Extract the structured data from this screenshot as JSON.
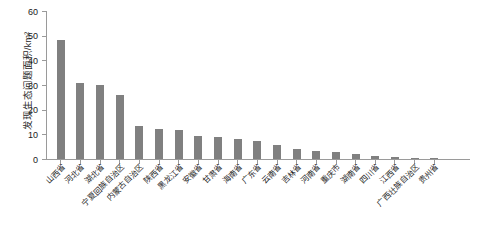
{
  "chart_data": {
    "type": "bar",
    "title": "",
    "xlabel": "",
    "ylabel": "发现生态问题面积/km²",
    "ylim": [
      0,
      60
    ],
    "yticks": [
      0,
      10,
      20,
      30,
      40,
      50,
      60
    ],
    "grid": false,
    "legend": "none",
    "bar_color": "#808080",
    "axis_color": "#9a9a9a",
    "categories": [
      "山西省",
      "河北省",
      "湖北省",
      "宁夏回族自治区",
      "内蒙古自治区",
      "陕西省",
      "黑龙江省",
      "安徽省",
      "甘肃省",
      "海南省",
      "广东省",
      "云南省",
      "吉林省",
      "河南省",
      "重庆市",
      "湖南省",
      "四川省",
      "江西省",
      "广西壮族自治区",
      "贵州省"
    ],
    "values": [
      48.2,
      30.7,
      30.2,
      26.1,
      13.2,
      12.1,
      11.9,
      9.3,
      9.0,
      8.1,
      7.2,
      5.6,
      3.9,
      3.2,
      2.9,
      2.2,
      1.2,
      0.8,
      0.5,
      0.3
    ]
  }
}
